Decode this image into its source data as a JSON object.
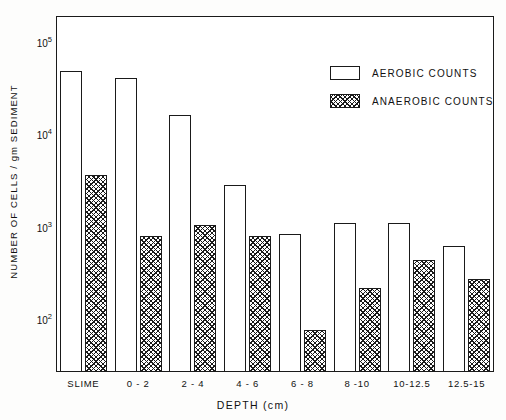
{
  "chart_data": {
    "type": "bar",
    "title": "",
    "xlabel": "DEPTH (cm)",
    "ylabel": "NUMBER OF CELLS / gm SEDIMENT",
    "yscale": "log",
    "ylim": [
      27,
      190000
    ],
    "grid": false,
    "legend_position": "top-right",
    "categories": [
      "SLIME",
      "0 - 2",
      "2 - 4",
      "4 - 6",
      "6 - 8",
      "8 -10",
      "10-12.5",
      "12.5-15"
    ],
    "ytick_labels": [
      "10⁵",
      "10⁴",
      "10³",
      "10²"
    ],
    "ytick_values": [
      100000,
      10000,
      1000,
      100
    ],
    "series": [
      {
        "name": "AEROBIC COUNTS",
        "style": "open",
        "values": [
          48000,
          41000,
          16000,
          2800,
          830,
          1100,
          1100,
          620
        ]
      },
      {
        "name": "ANAEROBIC COUNTS",
        "style": "hatched",
        "values": [
          3600,
          800,
          1050,
          790,
          76,
          220,
          440,
          270
        ]
      }
    ]
  },
  "legend": {
    "items": [
      {
        "label": "AEROBIC  COUNTS",
        "style": "aerobic"
      },
      {
        "label": "ANAEROBIC  COUNTS",
        "style": "anaerobic"
      }
    ]
  },
  "axes": {
    "y_title": "NUMBER OF CELLS / gm SEDIMENT",
    "x_title": "DEPTH (cm)"
  },
  "colors": {
    "ink": "#1a1a1a",
    "background": "#ffffff"
  }
}
